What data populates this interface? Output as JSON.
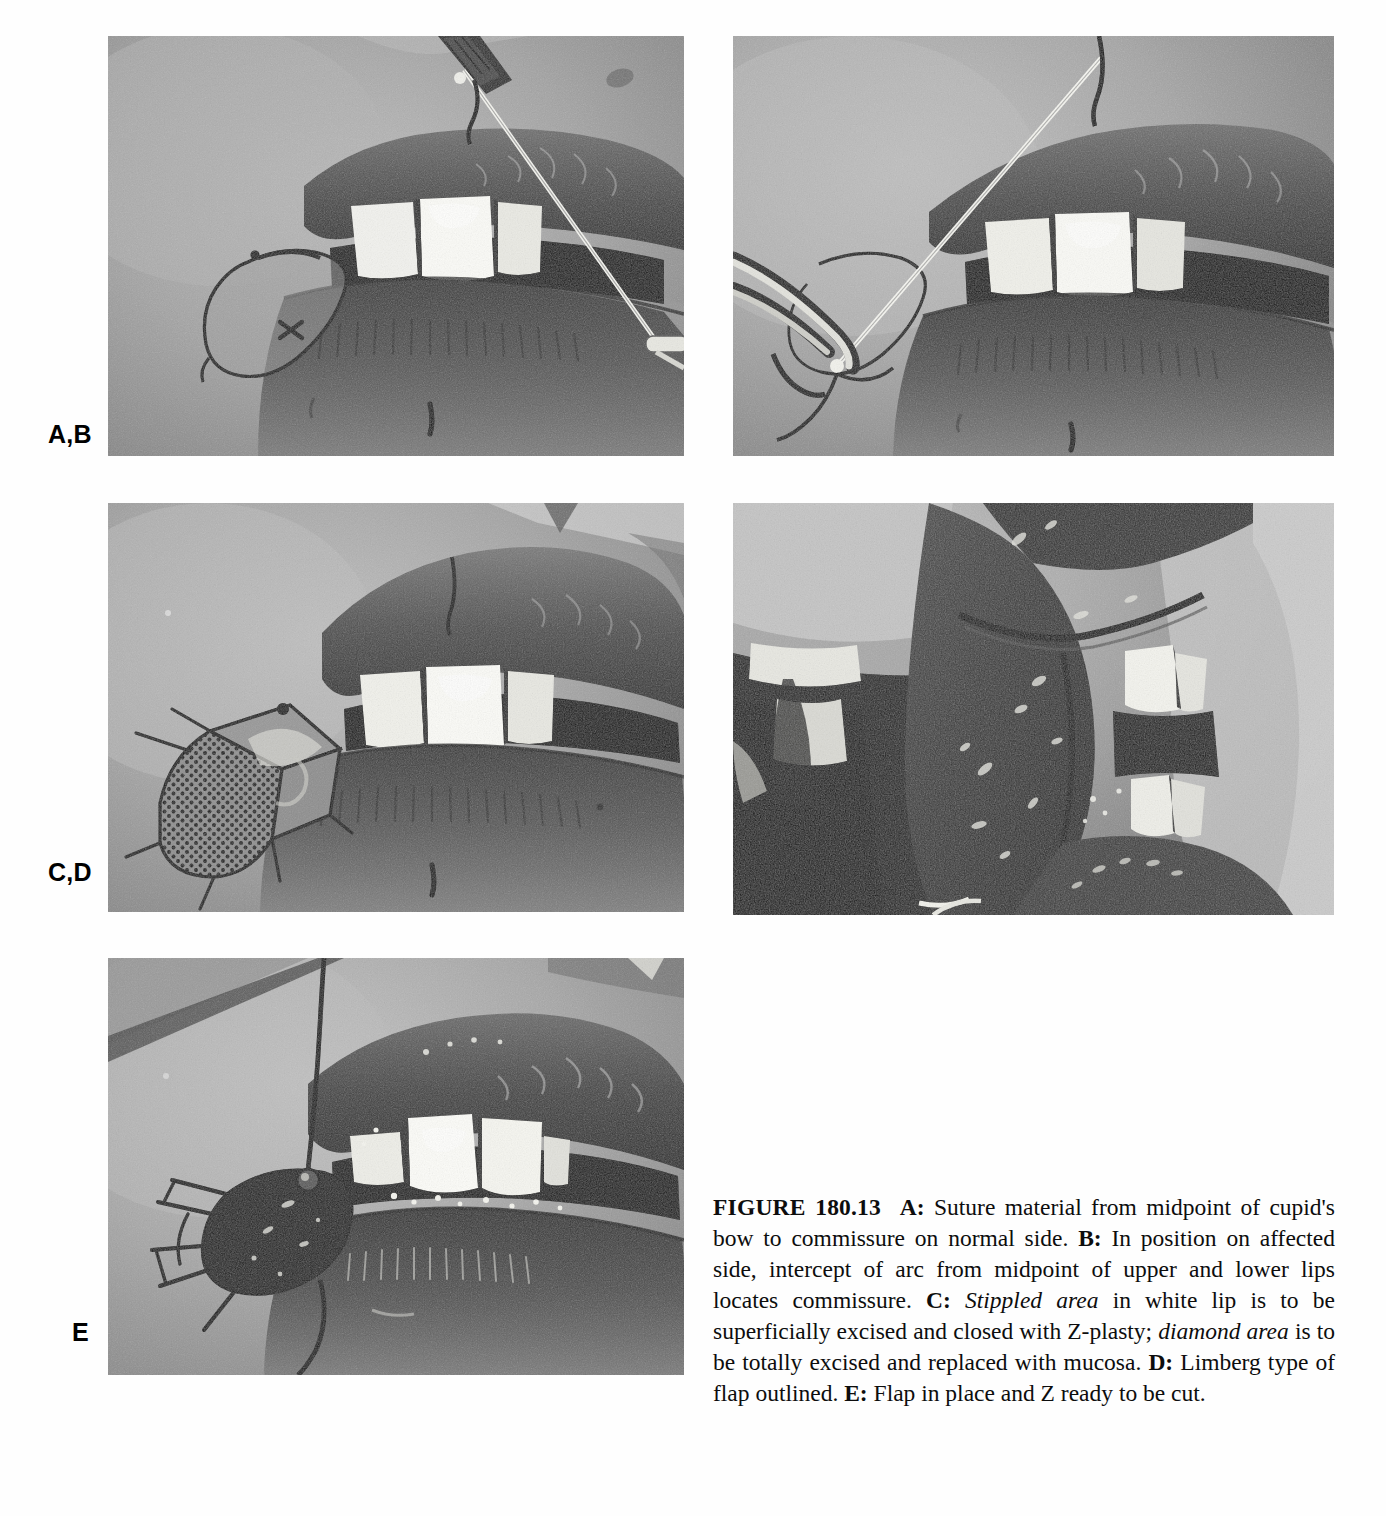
{
  "figure": {
    "number_label": "FIGURE 180.13",
    "row_labels": {
      "ab": "A,B",
      "cd": "C,D",
      "e": "E"
    },
    "caption": {
      "full_text": "FIGURE 180.13  A: Suture material from midpoint of cupid's bow to commissure on normal side. B: In position on affected side, intercept of arc from midpoint of upper and lower lips locates commissure. C: Stippled area in white lip is to be superficially excised and closed with Z-plasty; diamond area is to be totally excised and replaced with mucosa. D: Limberg type of flap outlined. E: Flap in place and Z ready to be cut.",
      "segments": {
        "a_id": "A:",
        "a_text": " Suture material from midpoint of cupid's bow to commissure on normal side. ",
        "b_id": "B:",
        "b_text": " In position on affected side, intercept of arc from midpoint of upper and lower lips locates commissure. ",
        "c_id": "C:",
        "c_italic_1": "Stippled area",
        "c_text_1": " in white lip is to be superficially excised and closed with Z-plasty; ",
        "c_italic_2": "diamond area",
        "c_text_2": " is to be totally excised and replaced with mucosa. ",
        "d_id": "D:",
        "d_text": " Limberg type of flap outlined. ",
        "e_id": "E:",
        "e_text": " Flap in place and Z ready to be cut."
      }
    },
    "panels": [
      {
        "id": "A",
        "alt": "Black and white clinical photograph of lower face showing mouth with upper teeth visible, suture thread stretched diagonally from upper lip toward lower right commissure, surgical ink outline of a teardrop shaped flap marked on the left commissure region"
      },
      {
        "id": "B",
        "alt": "Black and white clinical photograph of mouth with suture thread running diagonally from upper right down to left where a curved forceps holds it at the affected commissure, showing intercept of arc locating commissure"
      },
      {
        "id": "C",
        "alt": "Black and white clinical photograph of mouth showing stippled dotted area marked in white lip at left commissure adjacent to an outlined diamond shaped area with ink markings"
      },
      {
        "id": "D",
        "alt": "Dark black and white intraoral close-up photograph showing everted lip mucosa, upper and lower teeth, and the Limberg type flap outlined"
      },
      {
        "id": "E",
        "alt": "Black and white clinical photograph showing the dark mucosal flap transposed into place at the commissure with suture thread attached, Z-plasty limbs marked and ready to be cut"
      }
    ]
  }
}
